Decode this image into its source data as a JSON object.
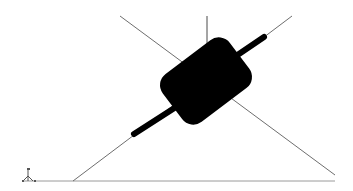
{
  "viewport": {
    "background": "#ffffff",
    "line_color": "#6e6e6e",
    "solid_color": "#000000"
  },
  "scene": {
    "construction_lines": [
      {
        "name": "diagonal-left",
        "x1": 120,
        "y1": 16,
        "x2": 335,
        "y2": 175
      },
      {
        "name": "vertical-axis",
        "x1": 207,
        "y1": 16,
        "x2": 207,
        "y2": 47
      },
      {
        "name": "shaft-axis",
        "x1": 292,
        "y1": 16,
        "x2": 73,
        "y2": 181
      }
    ],
    "ground_line": {
      "x1": 22,
      "y1": 181,
      "x2": 335,
      "y2": 181
    },
    "shaft_segments": [
      {
        "name": "shaft-lower",
        "x1": 134,
        "y1": 134,
        "x2": 175,
        "y2": 107
      },
      {
        "name": "shaft-upper",
        "x1": 238,
        "y1": 55,
        "x2": 264,
        "y2": 37
      }
    ],
    "cylinder": {
      "cx": 206,
      "cy": 81,
      "width": 82,
      "height": 60,
      "rotation": -37,
      "radius": 14
    },
    "axis_triad": {
      "x": 30,
      "y": 176
    }
  }
}
